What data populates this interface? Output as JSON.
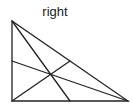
{
  "title": "right",
  "triangle": {
    "type": "right triangle",
    "vertices": {
      "top": [
        12,
        21
      ],
      "bottom_left": [
        12,
        101
      ],
      "bottom_right": [
        128,
        101
      ]
    },
    "midpoints": {
      "left_side": [
        12,
        61
      ],
      "bottom_side": [
        70,
        101
      ],
      "hypotenuse": [
        70,
        61
      ]
    },
    "centroid": [
      51,
      74
    ],
    "stroke_color": "#222222",
    "medians": 3
  }
}
